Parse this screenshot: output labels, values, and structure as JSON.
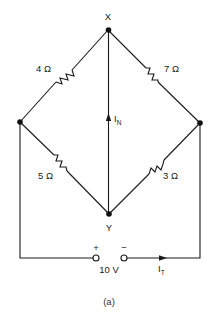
{
  "diagram": {
    "type": "bridge-circuit",
    "caption": "(a)",
    "nodes": {
      "top": {
        "label": "X"
      },
      "bottom": {
        "label": "Y"
      },
      "left": {
        "label": ""
      },
      "right": {
        "label": ""
      }
    },
    "resistors": [
      {
        "id": "r1",
        "value": "4 Ω",
        "between": [
          "left",
          "X"
        ]
      },
      {
        "id": "r2",
        "value": "7 Ω",
        "between": [
          "X",
          "right"
        ]
      },
      {
        "id": "r3",
        "value": "5 Ω",
        "between": [
          "left",
          "Y"
        ]
      },
      {
        "id": "r4",
        "value": "3 Ω",
        "between": [
          "Y",
          "right"
        ]
      }
    ],
    "source": {
      "voltage": "10 V",
      "plus": "+",
      "minus": "−"
    },
    "currents": {
      "norton": {
        "symbol": "I",
        "subscript": "N",
        "direction": "Y to X"
      },
      "total": {
        "symbol": "I",
        "subscript": "T",
        "direction": "toward right"
      }
    }
  },
  "colors": {
    "ink": "#1a1a1a",
    "background": "#ffffff"
  }
}
